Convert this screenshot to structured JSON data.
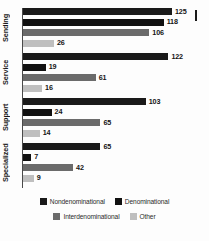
{
  "chart_data": {
    "type": "bar",
    "orientation": "horizontal",
    "title": "",
    "subtitle": "",
    "xlabel": "",
    "ylabel": "",
    "grid": false,
    "xlim": [
      0,
      125
    ],
    "legend_position": "bottom",
    "categories": [
      "Sending",
      "Service",
      "Support",
      "Specialized"
    ],
    "series": [
      {
        "name": "Nondenominational",
        "color": "#1a1a1a",
        "values": [
          125,
          122,
          103,
          65
        ]
      },
      {
        "name": "Denominational",
        "color": "#111111",
        "values": [
          118,
          19,
          24,
          7
        ]
      },
      {
        "name": "Interdenominational",
        "color": "#6b6b6b",
        "values": [
          106,
          61,
          65,
          42
        ]
      },
      {
        "name": "Other",
        "color": "#bfbfbf",
        "values": [
          26,
          16,
          14,
          9
        ]
      }
    ]
  },
  "legend": {
    "rows": [
      [
        {
          "label": "Nondenominational",
          "color": "#1a1a1a"
        },
        {
          "label": "Denominational",
          "color": "#111111"
        }
      ],
      [
        {
          "label": "Interdenominational",
          "color": "#6b6b6b"
        },
        {
          "label": "Other",
          "color": "#bfbfbf"
        }
      ]
    ]
  },
  "marks": {
    "corner_tick": "vertical-tick-mark"
  }
}
